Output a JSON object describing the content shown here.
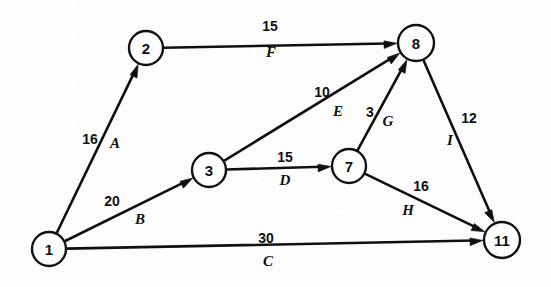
{
  "diagram": {
    "type": "directed-network-activity-diagram",
    "canvas": {
      "width": 551,
      "height": 287
    },
    "background_color": "#fdfdfd",
    "ink_color": "#101010",
    "nodes": [
      {
        "id": "n1",
        "label": "1",
        "x": 49,
        "y": 249,
        "r": 17
      },
      {
        "id": "n2",
        "label": "2",
        "x": 146,
        "y": 48,
        "r": 17
      },
      {
        "id": "n3",
        "label": "3",
        "x": 209,
        "y": 170,
        "r": 17
      },
      {
        "id": "n7",
        "label": "7",
        "x": 349,
        "y": 166,
        "r": 17
      },
      {
        "id": "n8",
        "label": "8",
        "x": 416,
        "y": 43,
        "r": 18
      },
      {
        "id": "n11",
        "label": "11",
        "x": 502,
        "y": 240,
        "r": 18
      }
    ],
    "edges": [
      {
        "id": "A",
        "name": "A",
        "weight": "16",
        "from": "n1",
        "to": "n2",
        "weight_x": 90,
        "weight_y": 139,
        "name_x": 115,
        "name_y": 143
      },
      {
        "id": "B",
        "name": "B",
        "weight": "20",
        "from": "n1",
        "to": "n3",
        "weight_x": 112,
        "weight_y": 201,
        "name_x": 140,
        "name_y": 219
      },
      {
        "id": "C",
        "name": "C",
        "weight": "30",
        "from": "n1",
        "to": "n11",
        "weight_x": 266,
        "weight_y": 238,
        "name_x": 268,
        "name_y": 261
      },
      {
        "id": "D",
        "name": "D",
        "weight": "15",
        "from": "n3",
        "to": "n7",
        "weight_x": 285,
        "weight_y": 157,
        "name_x": 285,
        "name_y": 180
      },
      {
        "id": "E",
        "name": "E",
        "weight": "10",
        "from": "n3",
        "to": "n8",
        "weight_x": 322,
        "weight_y": 92,
        "name_x": 338,
        "name_y": 111
      },
      {
        "id": "F",
        "name": "F",
        "weight": "15",
        "from": "n2",
        "to": "n8",
        "weight_x": 270,
        "weight_y": 26,
        "name_x": 271,
        "name_y": 52
      },
      {
        "id": "G",
        "name": "G",
        "weight": "3",
        "from": "n7",
        "to": "n8",
        "weight_x": 370,
        "weight_y": 112,
        "name_x": 388,
        "name_y": 121
      },
      {
        "id": "H",
        "name": "H",
        "weight": "16",
        "from": "n7",
        "to": "n11",
        "weight_x": 421,
        "weight_y": 186,
        "name_x": 408,
        "name_y": 210
      },
      {
        "id": "I",
        "name": "I",
        "weight": "12",
        "from": "n8",
        "to": "n11",
        "weight_x": 469,
        "weight_y": 118,
        "name_x": 450,
        "name_y": 140
      }
    ]
  },
  "chart_data": {
    "type": "diagram",
    "title": "",
    "nodes": [
      "1",
      "2",
      "3",
      "7",
      "8",
      "11"
    ],
    "edges": [
      {
        "label": "A",
        "from": "1",
        "to": "2",
        "value": 16
      },
      {
        "label": "B",
        "from": "1",
        "to": "3",
        "value": 20
      },
      {
        "label": "C",
        "from": "1",
        "to": "11",
        "value": 30
      },
      {
        "label": "D",
        "from": "3",
        "to": "7",
        "value": 15
      },
      {
        "label": "E",
        "from": "3",
        "to": "8",
        "value": 10
      },
      {
        "label": "F",
        "from": "2",
        "to": "8",
        "value": 15
      },
      {
        "label": "G",
        "from": "7",
        "to": "8",
        "value": 3
      },
      {
        "label": "H",
        "from": "7",
        "to": "11",
        "value": 16
      },
      {
        "label": "I",
        "from": "8",
        "to": "11",
        "value": 12
      }
    ]
  }
}
